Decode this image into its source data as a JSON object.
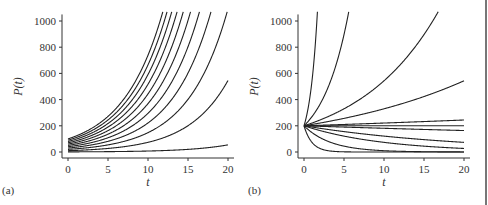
{
  "chart_data": [
    {
      "type": "line",
      "panel_label": "(a)",
      "title": "",
      "xlabel": "t",
      "ylabel": "P(t)",
      "xlim": [
        0,
        20
      ],
      "ylim": [
        0,
        1050
      ],
      "xticks": [
        "0",
        "5",
        "10",
        "15",
        "20"
      ],
      "yticks": [
        "0",
        "200",
        "400",
        "600",
        "800",
        "1000"
      ],
      "grid": false,
      "legend": null,
      "model": "P(t) = P0 * exp(0.2 t)",
      "growth_rate": 0.2,
      "series": [
        {
          "name": "P0=1",
          "P0": 1
        },
        {
          "name": "P0=10",
          "P0": 10
        },
        {
          "name": "P0=20",
          "P0": 20
        },
        {
          "name": "P0=30",
          "P0": 30
        },
        {
          "name": "P0=40",
          "P0": 40
        },
        {
          "name": "P0=50",
          "P0": 50
        },
        {
          "name": "P0=60",
          "P0": 60
        },
        {
          "name": "P0=70",
          "P0": 70
        },
        {
          "name": "P0=80",
          "P0": 80
        },
        {
          "name": "P0=90",
          "P0": 90
        },
        {
          "name": "P0=100",
          "P0": 100
        }
      ]
    },
    {
      "type": "line",
      "panel_label": "(b)",
      "title": "",
      "xlabel": "t",
      "ylabel": "P(t)",
      "xlim": [
        0,
        20
      ],
      "ylim": [
        0,
        1050
      ],
      "xticks": [
        "0",
        "5",
        "10",
        "15",
        "20"
      ],
      "yticks": [
        "0",
        "200",
        "400",
        "600",
        "800",
        "1000"
      ],
      "grid": false,
      "legend": null,
      "model": "P(t) = 200 * exp(r t)",
      "initial_value": 200,
      "series": [
        {
          "name": "r=1",
          "r": 1.0
        },
        {
          "name": "r=0.3",
          "r": 0.3
        },
        {
          "name": "r=0.1",
          "r": 0.1
        },
        {
          "name": "r=0.05",
          "r": 0.05
        },
        {
          "name": "r=0.01",
          "r": 0.01
        },
        {
          "name": "r=0",
          "r": 0.0
        },
        {
          "name": "r=-0.01",
          "r": -0.01
        },
        {
          "name": "r=-0.05",
          "r": -0.05
        },
        {
          "name": "r=-0.1",
          "r": -0.1
        },
        {
          "name": "r=-0.3",
          "r": -0.3
        },
        {
          "name": "r=-1",
          "r": -1.0
        }
      ]
    }
  ]
}
